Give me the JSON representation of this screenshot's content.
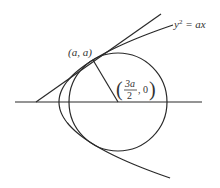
{
  "diagram": {
    "curve_label": "y² = ax",
    "curve_label_base": "y",
    "curve_label_exp": "2",
    "curve_label_rest": " = ax",
    "point_label": "(a, a)",
    "center_label": {
      "numerator": "3a",
      "denominator": "2",
      "suffix": ", 0"
    },
    "colors": {
      "stroke": "#2a2a2a",
      "text": "#333333",
      "background": "#ffffff"
    },
    "elements": [
      "horizontal axis",
      "parabola y² = ax",
      "circle centered at (3a/2, 0)",
      "tangent line at (a, a)",
      "radius from center to (a, a)"
    ]
  }
}
